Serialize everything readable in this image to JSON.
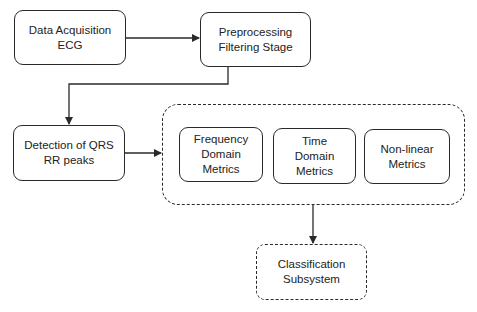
{
  "diagram": {
    "nodes": {
      "data_acquisition": {
        "label": "Data Acquisition\nECG"
      },
      "preprocessing": {
        "label": "Preprocessing\nFiltering Stage"
      },
      "detection": {
        "label": "Detection of QRS\nRR peaks"
      },
      "frequency_metrics": {
        "label": "Frequency\nDomain\nMetrics"
      },
      "time_metrics": {
        "label": "Time\nDomain\nMetrics"
      },
      "nonlinear_metrics": {
        "label": "Non-linear\nMetrics"
      },
      "classification": {
        "label": "Classification\nSubsystem"
      }
    },
    "groups": {
      "metrics_group": {
        "members": [
          "frequency_metrics",
          "time_metrics",
          "nonlinear_metrics"
        ],
        "style": "dashed"
      }
    },
    "edges": [
      {
        "from": "data_acquisition",
        "to": "preprocessing"
      },
      {
        "from": "preprocessing",
        "to": "detection"
      },
      {
        "from": "detection",
        "to": "metrics_group"
      },
      {
        "from": "metrics_group",
        "to": "classification"
      }
    ],
    "colors": {
      "stroke": "#2a2a2a",
      "text": "#222222",
      "background": "#ffffff"
    }
  }
}
